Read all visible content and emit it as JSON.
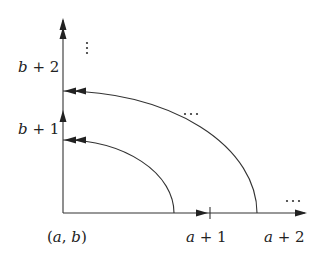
{
  "diagram": {
    "origin_label": "(a, b)",
    "x_axis": {
      "tick_labels": [
        "a + 1",
        "a + 2"
      ],
      "continuation": "…"
    },
    "y_axis": {
      "tick_labels": [
        "b + 1",
        "b + 2"
      ],
      "continuation": "⋮"
    },
    "arcs": [
      {
        "name": "inner-arc",
        "from": "a + 1 (approx)",
        "to": "b + 1"
      },
      {
        "name": "outer-arc",
        "from": "a + 2 (approx)",
        "to": "b + 2"
      }
    ],
    "middle_continuation": "…",
    "colors": {
      "stroke": "#333333",
      "background": "#ffffff"
    }
  }
}
